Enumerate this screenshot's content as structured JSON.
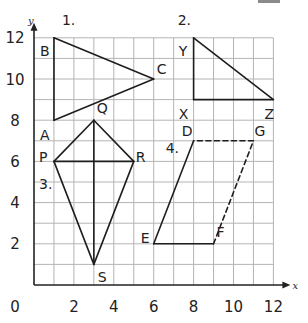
{
  "chart_data": {
    "type": "diagram",
    "title": "",
    "xlabel": "x",
    "ylabel": "y",
    "xlim": [
      0,
      12
    ],
    "ylim": [
      0,
      12
    ],
    "grid": true,
    "origin_label": "0",
    "x_ticks": [
      "2",
      "4",
      "6",
      "8",
      "10",
      "12"
    ],
    "y_ticks": [
      "2",
      "4",
      "6",
      "8",
      "10",
      "12"
    ],
    "figures": [
      {
        "id": "1",
        "label": "1.",
        "label_at": [
          1.4,
          12.6
        ],
        "kind": "triangle",
        "points": {
          "A": [
            1,
            8
          ],
          "B": [
            1,
            12
          ],
          "C": [
            6,
            10
          ]
        },
        "segments": [
          [
            "A",
            "B",
            "solid"
          ],
          [
            "B",
            "C",
            "solid"
          ],
          [
            "C",
            "A",
            "solid"
          ]
        ]
      },
      {
        "id": "2",
        "label": "2.",
        "label_at": [
          7.2,
          12.6
        ],
        "kind": "triangle",
        "points": {
          "Y": [
            8,
            12
          ],
          "X": [
            8,
            9
          ],
          "Z": [
            12,
            9
          ]
        },
        "segments": [
          [
            "Y",
            "X",
            "solid"
          ],
          [
            "X",
            "Z",
            "solid"
          ],
          [
            "Z",
            "Y",
            "solid"
          ]
        ]
      },
      {
        "id": "3",
        "label": "3.",
        "label_at": [
          0.25,
          4.65
        ],
        "kind": "kite",
        "points": {
          "P": [
            1,
            6
          ],
          "Q": [
            3,
            8
          ],
          "R": [
            5,
            6
          ],
          "S": [
            3,
            1
          ]
        },
        "segments": [
          [
            "P",
            "Q",
            "solid"
          ],
          [
            "Q",
            "R",
            "solid"
          ],
          [
            "R",
            "S",
            "solid"
          ],
          [
            "S",
            "P",
            "solid"
          ],
          [
            "P",
            "R",
            "solid"
          ],
          [
            "Q",
            "S",
            "solid"
          ]
        ]
      },
      {
        "id": "4",
        "label": "4.",
        "label_at": [
          6.6,
          6.4
        ],
        "kind": "parallelogram",
        "points": {
          "D": [
            8,
            7
          ],
          "E": [
            6,
            2
          ],
          "F": [
            9,
            2
          ],
          "G": [
            11,
            7
          ]
        },
        "segments": [
          [
            "D",
            "E",
            "solid"
          ],
          [
            "E",
            "F",
            "solid"
          ],
          [
            "F",
            "G",
            "dashed"
          ],
          [
            "G",
            "D",
            "dashed"
          ]
        ]
      }
    ],
    "point_labels": [
      {
        "text": "B",
        "at": [
          0.3,
          11.1
        ]
      },
      {
        "text": "A",
        "at": [
          0.3,
          7.05
        ]
      },
      {
        "text": "C",
        "at": [
          6.15,
          10.25
        ]
      },
      {
        "text": "Y",
        "at": [
          7.25,
          11.1
        ]
      },
      {
        "text": "X",
        "at": [
          7.25,
          8.05
        ]
      },
      {
        "text": "Z",
        "at": [
          11.55,
          8.05
        ]
      },
      {
        "text": "Q",
        "at": [
          3.15,
          8.35
        ]
      },
      {
        "text": "P",
        "at": [
          0.25,
          5.95
        ]
      },
      {
        "text": "R",
        "at": [
          5.1,
          5.95
        ]
      },
      {
        "text": "S",
        "at": [
          3.2,
          0.15
        ]
      },
      {
        "text": "D",
        "at": [
          7.4,
          7.25
        ]
      },
      {
        "text": "G",
        "at": [
          11.05,
          7.25
        ]
      },
      {
        "text": "E",
        "at": [
          5.35,
          2.05
        ]
      },
      {
        "text": "F",
        "at": [
          9.15,
          2.35
        ]
      }
    ]
  }
}
